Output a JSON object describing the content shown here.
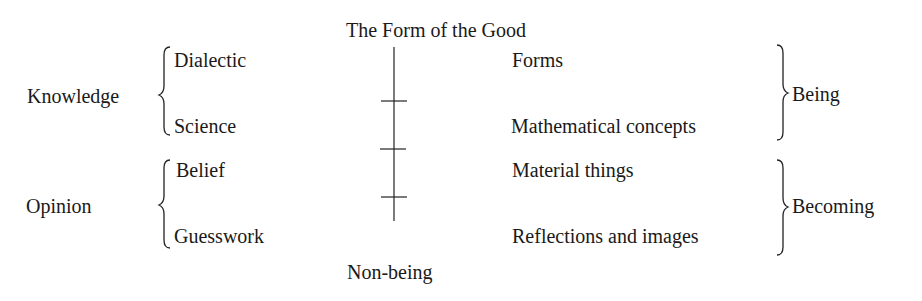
{
  "diagram": {
    "top_label": "The Form of the Good",
    "bottom_label": "Non-being",
    "left_groups": [
      {
        "label": "Knowledge",
        "items": [
          "Dialectic",
          "Science"
        ]
      },
      {
        "label": "Opinion",
        "items": [
          "Belief",
          "Guesswork"
        ]
      }
    ],
    "right_groups": [
      {
        "label": "Being",
        "items": [
          "Forms",
          "Mathematical concepts"
        ]
      },
      {
        "label": "Becoming",
        "items": [
          "Material things",
          "Reflections and images"
        ]
      }
    ],
    "divided_line": {
      "segments": 4,
      "tick_count": 3
    }
  }
}
